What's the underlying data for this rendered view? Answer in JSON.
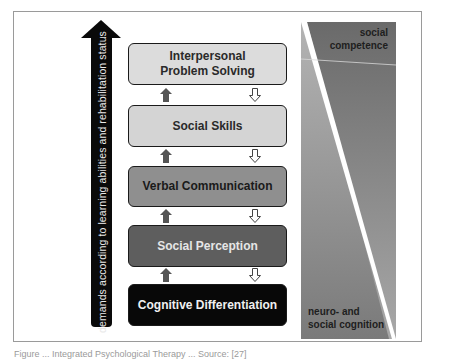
{
  "diagram": {
    "vertical_arrow_label": "demands according to learning abilities and rehabilitation status",
    "levels": [
      {
        "label_line1": "Interpersonal",
        "label_line2": "Problem Solving",
        "fill": "#dcdcdc"
      },
      {
        "label_line1": "Social Skills",
        "label_line2": "",
        "fill": "#d4d4d4"
      },
      {
        "label_line1": "Verbal Communication",
        "label_line2": "",
        "fill": "#8f8f8f"
      },
      {
        "label_line1": "Social Perception",
        "label_line2": "",
        "fill": "#5e5e5e"
      },
      {
        "label_line1": "Cognitive Differentiation",
        "label_line2": "",
        "fill": "#080808"
      }
    ],
    "connectors": {
      "up_arrow_style": "filled dark gray",
      "down_arrow_style": "outlined white"
    },
    "gradient_panel": {
      "top_label_line1": "social",
      "top_label_line2": "competence",
      "bottom_label_line1": "neuro- and",
      "bottom_label_line2": "social cognition"
    }
  },
  "caption": "Figure ... Integrated Psychological Therapy ... Source: [27]"
}
